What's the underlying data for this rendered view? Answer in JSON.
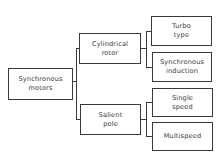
{
  "diagram": {
    "type": "tree",
    "root": {
      "label": "Synchronous\nmotors",
      "children": [
        {
          "label": "Cylindrical\nrotor",
          "children": [
            {
              "label": "Turbo\ntype"
            },
            {
              "label": "Synchronous\ninduction"
            }
          ]
        },
        {
          "label": "Salient\npole",
          "children": [
            {
              "label": "Single\nspeed"
            },
            {
              "label": "Multispeed"
            }
          ]
        }
      ]
    }
  },
  "nodes": {
    "synchronous_motors": "Synchronous\nmotors",
    "cylindrical_rotor": "Cylindrical\nrotor",
    "salient_pole": "Salient\npole",
    "turbo_type": "Turbo\ntype",
    "synchronous_induction": "Synchronous\ninduction",
    "single_speed": "Single\nspeed",
    "multispeed": "Multispeed"
  },
  "colors": {
    "line": "#3a3a3a",
    "background": "#ffffff"
  }
}
